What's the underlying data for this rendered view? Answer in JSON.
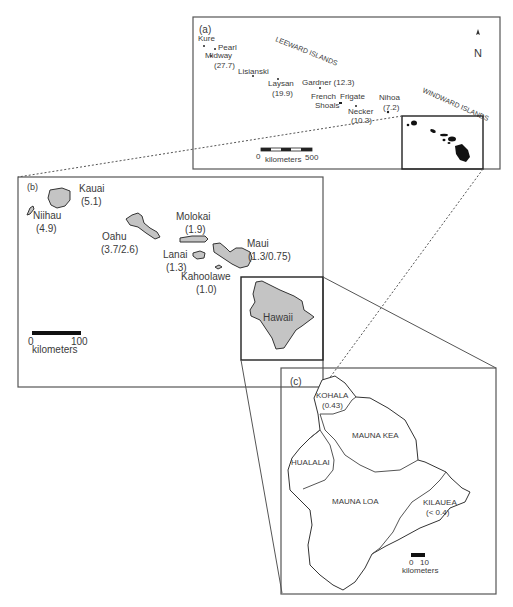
{
  "figure": {
    "panel_a": {
      "label": "(a)",
      "north_arrow": "N",
      "region_labels": [
        "LEEWARD ISLANDS",
        "WINDWARD ISLANDS"
      ],
      "islands": [
        {
          "name": "Kure",
          "age": ""
        },
        {
          "name": "Pearl",
          "age": ""
        },
        {
          "name": "Midway",
          "age": "(27.7)"
        },
        {
          "name": "Lisianski",
          "age": ""
        },
        {
          "name": "Laysan",
          "age": "(19.9)"
        },
        {
          "name": "Gardner (12.3)",
          "age": ""
        },
        {
          "name": "French",
          "name2": "Shoals",
          "age": ""
        },
        {
          "name": "Frigate",
          "age": ""
        },
        {
          "name": "Necker",
          "age": "(10.3)"
        },
        {
          "name": "Nihoa",
          "age": "(7.2)"
        }
      ],
      "scale": {
        "start": "0",
        "end": "500",
        "unit": "kilometers"
      }
    },
    "panel_b": {
      "label": "(b)",
      "islands": [
        {
          "name": "Kauai",
          "age": "(5.1)"
        },
        {
          "name": "Niihau",
          "age": "(4.9)"
        },
        {
          "name": "Oahu",
          "age": "(3.7/2.6)"
        },
        {
          "name": "Molokai",
          "age": "(1.9)"
        },
        {
          "name": "Lanai",
          "age": "(1.3)"
        },
        {
          "name": "Maui",
          "age": "(1.3/0.75)"
        },
        {
          "name": "Kahoolawe",
          "age": "(1.0)"
        },
        {
          "name": "Hawaii",
          "age": ""
        }
      ],
      "scale": {
        "start": "0",
        "end": "100",
        "unit": "kilometers"
      }
    },
    "panel_c": {
      "label": "(c)",
      "volcanoes": [
        {
          "name": "KOHALA",
          "age": "(0.43)"
        },
        {
          "name": "MAUNA KEA",
          "age": ""
        },
        {
          "name": "HUALALAI",
          "age": ""
        },
        {
          "name": "MAUNA LOA",
          "age": ""
        },
        {
          "name": "KILAUEA",
          "age": "(< 0.4)"
        }
      ],
      "scale": {
        "start": "0",
        "end": "10",
        "unit": "kilometers"
      }
    }
  }
}
